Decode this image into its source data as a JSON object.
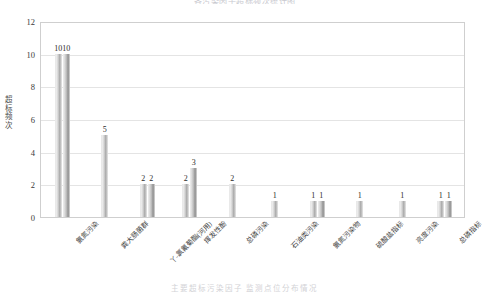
{
  "chart_data": {
    "type": "bar",
    "title": "各污染因子超标频次统计图",
    "caption": "主要超标污染因子     监测点位分布情况",
    "xlabel": "",
    "ylabel": "超标频次",
    "ylim": [
      0,
      12
    ],
    "yticks": [
      0,
      2,
      4,
      6,
      8,
      10,
      12
    ],
    "grid": true,
    "legend": "none",
    "categories": [
      "氨氮污染",
      "粪大肠菌群",
      "丫-氯氰菊酯(河用)",
      "挥发性酚",
      "总磷污染",
      "石油类污染",
      "氨氮污染物",
      "硫酸盐指标",
      "亮度污染",
      "总磷指标"
    ],
    "groups": [
      {
        "label": "氨氮污染",
        "values": [
          10,
          10
        ]
      },
      {
        "label": "粪大肠菌群",
        "values": [
          5
        ]
      },
      {
        "label": "丫-氯氰菊酯(河用)",
        "values": [
          2,
          2
        ]
      },
      {
        "label": "挥发性酚",
        "values": [
          2,
          3
        ]
      },
      {
        "label": "总磷污染",
        "values": [
          2
        ]
      },
      {
        "label": "石油类污染",
        "values": [
          1
        ]
      },
      {
        "label": "氨氮污染物",
        "values": [
          1,
          1
        ]
      },
      {
        "label": "硫酸盐指标",
        "values": [
          1
        ]
      },
      {
        "label": "亮度污染",
        "values": [
          1
        ]
      },
      {
        "label": "总磷指标",
        "values": [
          1,
          1
        ]
      }
    ],
    "bar_color": "#c2c2c2",
    "bar_color_dark": "#9a9a9a",
    "grid_color": "#e4e4e4",
    "frame_color": "#cfcfcf"
  }
}
